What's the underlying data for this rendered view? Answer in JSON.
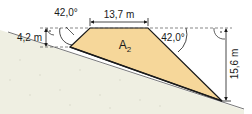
{
  "diagram": {
    "type": "embankment-cross-section",
    "area_label": "A",
    "area_subscript": "2",
    "dimensions": {
      "top_width": "13,7 m",
      "left_height": "4,2 m",
      "right_height": "15,6 m"
    },
    "angles": {
      "left": "42,0°",
      "right": "42,0°"
    },
    "colors": {
      "fill_area": "#f6d79a",
      "ground": "#efefe2",
      "line": "#1a1a1a",
      "dashed": "#555555"
    }
  }
}
